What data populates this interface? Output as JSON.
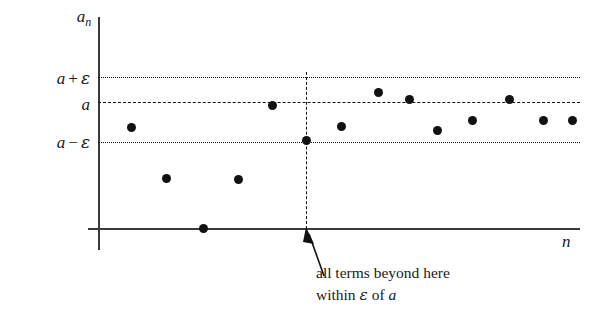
{
  "figure": {
    "axes": {
      "y_label": "a",
      "y_label_sub": "n",
      "x_label": "n"
    },
    "reference_lines": [
      {
        "name": "upper-bound",
        "label_a": "a",
        "label_op": "+",
        "label_eps": "ε",
        "y": 77,
        "style": "dotted"
      },
      {
        "name": "limit",
        "label_a": "a",
        "label_op": "",
        "label_eps": "",
        "y": 102,
        "style": "dashed"
      },
      {
        "name": "lower-bound",
        "label_a": "a",
        "label_op": "−",
        "label_eps": "ε",
        "y": 142,
        "style": "dotted"
      }
    ],
    "threshold_line": {
      "name": "threshold-N",
      "x": 306
    },
    "annotation": {
      "line1": "all terms beyond here",
      "line2_before": "within ",
      "line2_eps": "ε",
      "line2_mid": " of ",
      "line2_a": "a"
    },
    "colors": {
      "ink": "#111111",
      "axis": "#3a3a3a",
      "background": "#ffffff"
    }
  },
  "chart_data": {
    "type": "scatter",
    "xlabel": "n",
    "ylabel": "a_n",
    "grid": false,
    "legend": "none",
    "axis_origin": {
      "x": 98,
      "y": 228
    },
    "value_lines": {
      "a_plus_epsilon": 77,
      "a": 102,
      "a_minus_epsilon": 142
    },
    "threshold_x": 306,
    "note": "Pixel coordinates: y increases downward; value axis is inverted relative to a_n.",
    "points": [
      {
        "n": 1,
        "x": 131,
        "y": 127
      },
      {
        "n": 2,
        "x": 166,
        "y": 178
      },
      {
        "n": 3,
        "x": 203,
        "y": 228
      },
      {
        "n": 4,
        "x": 238,
        "y": 179
      },
      {
        "n": 5,
        "x": 272,
        "y": 105
      },
      {
        "n": 6,
        "x": 306,
        "y": 140
      },
      {
        "n": 7,
        "x": 341,
        "y": 126
      },
      {
        "n": 8,
        "x": 378,
        "y": 92
      },
      {
        "n": 9,
        "x": 409,
        "y": 99
      },
      {
        "n": 10,
        "x": 437,
        "y": 130
      },
      {
        "n": 11,
        "x": 472,
        "y": 120
      },
      {
        "n": 12,
        "x": 509,
        "y": 99
      },
      {
        "n": 13,
        "x": 543,
        "y": 120
      },
      {
        "n": 14,
        "x": 572,
        "y": 120
      }
    ]
  }
}
